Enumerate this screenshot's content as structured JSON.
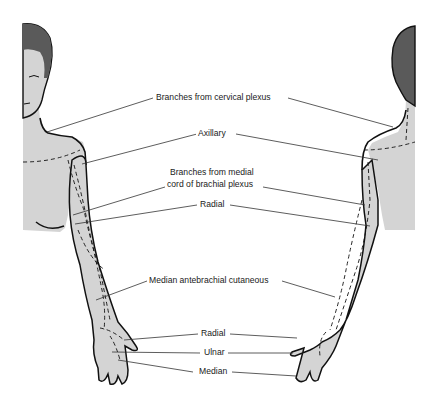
{
  "diagram": {
    "type": "anatomical-illustration",
    "colors": {
      "skin": "#d4d4d4",
      "hair": "#5a5a5a",
      "outline": "#111111",
      "leader_line": "#333333",
      "text": "#1a1a1a",
      "background": "#ffffff"
    },
    "labels": [
      {
        "id": "cervical",
        "text": "Branches from cervical plexus"
      },
      {
        "id": "axillary",
        "text": "Axillary"
      },
      {
        "id": "medial_cord_1",
        "text": "Branches from medial"
      },
      {
        "id": "medial_cord_2",
        "text": "cord of brachial plexus"
      },
      {
        "id": "radial_upper",
        "text": "Radial"
      },
      {
        "id": "median_antebrachial",
        "text": "Median antebrachial cutaneous"
      },
      {
        "id": "radial_hand",
        "text": "Radial"
      },
      {
        "id": "ulnar",
        "text": "Ulnar"
      },
      {
        "id": "median",
        "text": "Median"
      }
    ]
  }
}
